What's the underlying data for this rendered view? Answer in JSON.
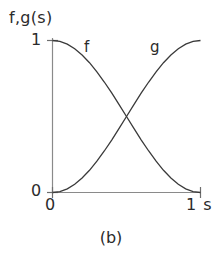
{
  "figure": {
    "caption": "(b)",
    "y_axis_title": "f,g(s)",
    "y_ticks": [
      "1",
      "0"
    ],
    "x_ticks": [
      "0",
      "1 s"
    ],
    "curve_labels": [
      "f",
      "g"
    ],
    "line_color": "#333333",
    "axis_color": "#808080",
    "background": "#ffffff"
  },
  "chart_data": {
    "type": "line",
    "title": "(b)",
    "xlabel": "1 s",
    "ylabel": "f,g(s)",
    "xlim": [
      0,
      1
    ],
    "ylim": [
      0,
      1
    ],
    "xticks": [
      0,
      1
    ],
    "xticklabels": [
      "0",
      "1 s"
    ],
    "yticks": [
      0,
      1
    ],
    "yticklabels": [
      "0",
      "1"
    ],
    "grid": false,
    "legend": "inline-labels",
    "annotations": [
      {
        "text": "f",
        "x": 0.22,
        "y": 0.96
      },
      {
        "text": "g",
        "x": 0.66,
        "y": 0.96
      }
    ],
    "x": [
      0,
      0.05,
      0.1,
      0.15,
      0.2,
      0.25,
      0.3,
      0.35,
      0.4,
      0.45,
      0.5,
      0.55,
      0.6,
      0.65,
      0.7,
      0.75,
      0.8,
      0.85,
      0.9,
      0.95,
      1
    ],
    "series": [
      {
        "name": "f",
        "description": "smooth decreasing S-curve from 1 to 0",
        "values": [
          1,
          0.994,
          0.976,
          0.946,
          0.905,
          0.854,
          0.794,
          0.727,
          0.655,
          0.578,
          0.5,
          0.422,
          0.345,
          0.273,
          0.206,
          0.146,
          0.095,
          0.054,
          0.024,
          0.006,
          0
        ]
      },
      {
        "name": "g",
        "description": "smooth increasing S-curve from 0 to 1",
        "values": [
          0,
          0.006,
          0.024,
          0.054,
          0.095,
          0.146,
          0.206,
          0.273,
          0.345,
          0.422,
          0.5,
          0.578,
          0.655,
          0.727,
          0.794,
          0.854,
          0.905,
          0.946,
          0.976,
          0.994,
          1
        ]
      }
    ],
    "crossing_point": {
      "x": 0.5,
      "y": 0.5
    }
  }
}
